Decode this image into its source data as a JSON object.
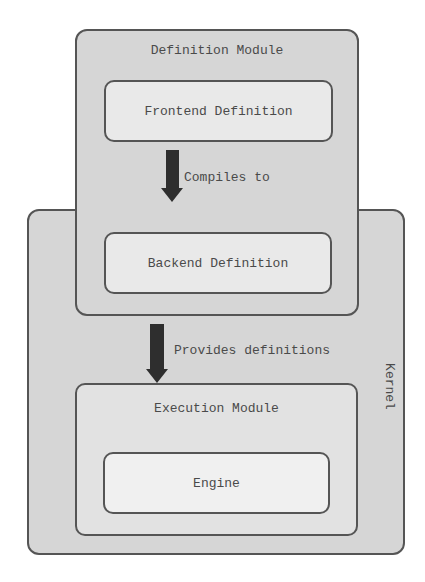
{
  "diagram": {
    "kernel": {
      "label": "Kernel"
    },
    "definition_module": {
      "title": "Definition Module",
      "frontend": {
        "label": "Frontend Definition"
      },
      "backend": {
        "label": "Backend Definition"
      }
    },
    "arrows": {
      "compile": {
        "label": "Compiles to"
      },
      "provide": {
        "label": "Provides definitions"
      }
    },
    "execution_module": {
      "title": "Execution Module",
      "engine": {
        "label": "Engine"
      }
    }
  },
  "colors": {
    "background": "#ffffff",
    "outer_fill": "#d6d6d6",
    "inner_fill": "#e9e9e9",
    "border": "#555555",
    "arrow": "#2e2e2e",
    "text": "#4a4a4a"
  }
}
